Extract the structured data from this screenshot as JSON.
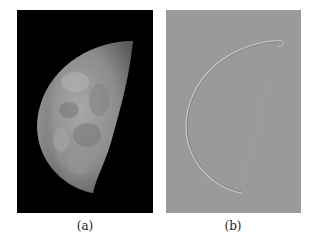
{
  "figure": {
    "panels": [
      {
        "label": "(a)",
        "description": "Photograph of a waning half moon on black background",
        "background": "#000000"
      },
      {
        "label": "(b)",
        "description": "Edge-filtered version of the moon image showing thin outline on gray background",
        "background": "#9a9a9a"
      }
    ]
  }
}
